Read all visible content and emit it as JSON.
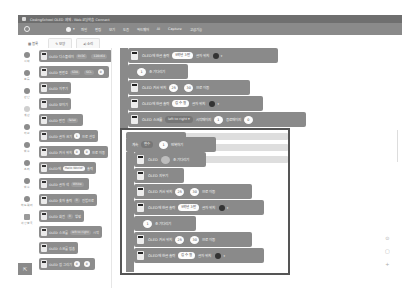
{
  "window": {
    "title": "CodingSchool OLED 예제 - Web 코딩학습 Connect"
  },
  "menubar": {
    "items": [
      "파일",
      "편집",
      "보기",
      "도움",
      "하드웨어",
      "AI",
      "Capture",
      "고급기능"
    ]
  },
  "tabs": [
    {
      "label": "블록",
      "icon": "block-icon"
    },
    {
      "label": "모양",
      "icon": "brush-icon"
    },
    {
      "label": "소리",
      "icon": "sound-icon"
    }
  ],
  "categories": [
    {
      "label": "시작",
      "shade": "dark"
    },
    {
      "label": "흐름",
      "shade": "dark"
    },
    {
      "label": "판단",
      "shade": "dark"
    },
    {
      "label": "계산",
      "shade": "light"
    },
    {
      "label": "자료",
      "shade": "dark"
    },
    {
      "label": "함수",
      "shade": "dark"
    },
    {
      "label": "소리",
      "shade": "dark"
    },
    {
      "label": "함수",
      "shade": "dark"
    },
    {
      "label": "하드웨어",
      "shade": "dark"
    },
    {
      "label": "확장블록",
      "shade": "icon"
    }
  ],
  "hardware_button": {
    "icon": "hardware-connect-icon"
  },
  "palette": {
    "blocks": [
      {
        "text": "OLED 디스플레이",
        "pills": [
          "0x3C",
          "128x64"
        ]
      },
      {
        "text": "OLED 핀번호",
        "pills": [
          "SDA",
          "SCL"
        ],
        "round": "0"
      },
      {
        "text": "OLED 지우기"
      },
      {
        "text": "OLED 보이기"
      },
      {
        "text": "OLED 반전",
        "pills": [
          "false"
        ]
      },
      {
        "text": "OLED 글자 크기",
        "round": "1",
        "tail": "으로 설정"
      },
      {
        "text": "OLED 커서 위치",
        "round": "0",
        "round2": "0",
        "tail": "으로 이동"
      },
      {
        "text": "OLED에",
        "pills": [
          "Hello World!"
        ],
        "tail": "출력"
      },
      {
        "text": "OLED 글자 색",
        "pills": [
          "White"
        ]
      },
      {
        "text": "OLED 숫자 출력",
        "pills": [
          "0"
        ],
        "tail": "진법으로"
      },
      {
        "text": "OLED 회전",
        "pills": [
          "0"
        ],
        "tail": "방향"
      },
      {
        "text": "OLED 스크롤",
        "pills": [
          "left to right"
        ],
        "tail": "시작"
      },
      {
        "text": "OLED 스크롤 멈춤"
      },
      {
        "text": "OLED 점 그리기",
        "round": "0",
        "round2": "0"
      }
    ]
  },
  "canvas": {
    "top_stack": [
      {
        "type": "oled",
        "text": "OLED에 한글 출력",
        "value": "5학년 3반",
        "tail": "글자 위치",
        "gear": true
      },
      {
        "type": "wait",
        "round": "1",
        "text": "초 기다리기"
      },
      {
        "type": "oled",
        "text": "OLED 커서 위치",
        "round": "25",
        "round2": "30",
        "tail": "으로 이동"
      },
      {
        "type": "oled",
        "text": "OLED에 한글 출력",
        "value": "김 수 철",
        "tail": "글자 위치",
        "gear": true
      },
      {
        "type": "oled",
        "text": "OLED 스크롤",
        "dropdown": "left to right ▾",
        "tail": "시작페이지",
        "round": "1",
        "tail2": "종료페이지",
        "round2": "0"
      }
    ],
    "repeat": {
      "prefix": "계속",
      "var": "변수",
      "round": "1",
      "suffix": "반복하기"
    },
    "inner_stack": [
      {
        "type": "oled",
        "text": "OLED",
        "round": "",
        "tail": "초 기다리기"
      },
      {
        "type": "oled",
        "text": "OLED 지우기"
      },
      {
        "type": "oled",
        "text": "OLED 커서 위치",
        "round": "25",
        "round2": "30",
        "tail": "으로 이동"
      },
      {
        "type": "oled",
        "text": "OLED에 한글 출력",
        "value": "5학년 3반",
        "tail": "글자 위치",
        "gear": true
      },
      {
        "type": "wait",
        "round": "1",
        "text": "초 기다리기"
      },
      {
        "type": "oled",
        "text": "OLED 커서 위치",
        "round": "25",
        "round2": "30",
        "tail": "으로 이동"
      },
      {
        "type": "oled",
        "text": "OLED에 한글 출력",
        "value": "김 수 철",
        "tail": "글자 위치",
        "gear": true
      }
    ]
  },
  "zoom_controls": {
    "reset": "⊙",
    "fit": "▢",
    "zoom_in": "+"
  },
  "colors": {
    "block": "#8a8a8a",
    "titlebar": "#6f6f6f",
    "menubar": "#8a8a8a",
    "selection": "#555555"
  }
}
